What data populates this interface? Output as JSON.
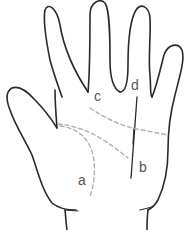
{
  "figure": {
    "stroke_color": "#2a2a2a",
    "dashed_color": "#b0b0b0",
    "label_color": "#555555",
    "labels": [
      {
        "id": "a",
        "text": "a",
        "x": 78,
        "y": 173
      },
      {
        "id": "b",
        "text": "b",
        "x": 139,
        "y": 160
      },
      {
        "id": "c",
        "text": "c",
        "x": 94,
        "y": 89
      },
      {
        "id": "d",
        "text": "d",
        "x": 131,
        "y": 78
      }
    ]
  }
}
